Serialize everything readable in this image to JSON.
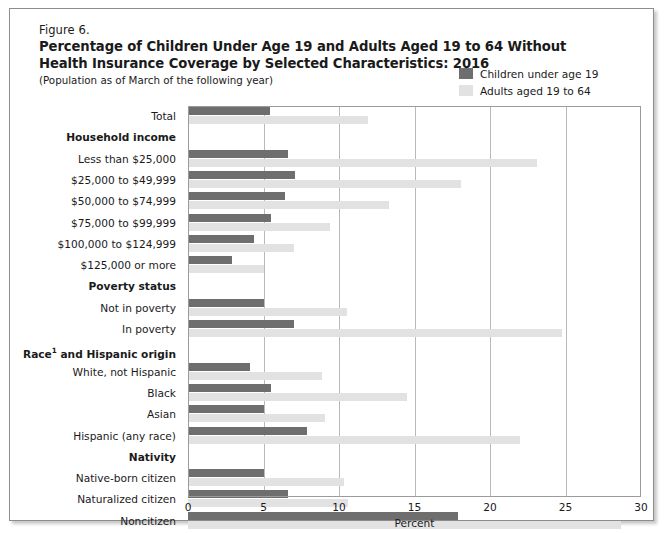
{
  "figure": {
    "number": "Figure 6.",
    "title_line1": "Percentage of Children Under Age 19 and Adults Aged 19 to 64 Without",
    "title_line2": "Health Insurance Coverage by Selected Characteristics: 2016",
    "subtitle": "(Population as of March of the following year)"
  },
  "legend": {
    "position": "top-right",
    "entries": [
      {
        "label": "Children under age 19",
        "color": "#6e6e6e"
      },
      {
        "label": "Adults aged 19 to 64",
        "color": "#e2e2e2"
      }
    ]
  },
  "colors": {
    "children_bar": "#6e6e6e",
    "adults_bar": "#e2e2e2",
    "gridline": "#b9b9b9",
    "frame": "#9b9b9b",
    "text": "#1a1a1a"
  },
  "chart_data": {
    "type": "bar",
    "orientation": "horizontal",
    "title": "Percentage of Children Under Age 19 and Adults Aged 19 to 64 Without Health Insurance Coverage by Selected Characteristics: 2016",
    "subtitle": "(Population as of March of the following year)",
    "xlabel": "Percent",
    "ylabel": "",
    "xlim": [
      0,
      30
    ],
    "xticks": [
      0,
      5,
      10,
      15,
      20,
      25,
      30
    ],
    "xtick_labels": [
      "0",
      "5",
      "10",
      "15",
      "20",
      "25",
      "30"
    ],
    "grid": "vertical",
    "legend_position": "top-right",
    "categories": [
      "Total",
      "Less than $25,000",
      "$25,000 to $49,999",
      "$50,000 to $74,999",
      "$75,000 to $99,999",
      "$100,000 to $124,999",
      "$125,000 or more",
      "Not in poverty",
      "In poverty",
      "White, not Hispanic",
      "Black",
      "Asian",
      "Hispanic (any race)",
      "Native-born citizen",
      "Naturalized citizen",
      "Noncitizen"
    ],
    "series": [
      {
        "name": "Children under age 19",
        "color": "#6e6e6e",
        "values": [
          5.4,
          6.6,
          7.1,
          6.4,
          5.5,
          4.4,
          2.9,
          5.0,
          7.0,
          4.1,
          5.5,
          5.0,
          7.9,
          5.0,
          6.6,
          17.9
        ]
      },
      {
        "name": "Adults aged 19 to 64",
        "color": "#e2e2e2",
        "values": [
          11.9,
          23.1,
          18.1,
          13.3,
          9.4,
          7.0,
          5.0,
          10.5,
          24.8,
          8.9,
          14.5,
          9.1,
          22.0,
          10.3,
          10.6,
          28.7
        ]
      }
    ]
  },
  "rows": [
    {
      "label": "Total",
      "type": "category",
      "children": 5.4,
      "adults": 11.9
    },
    {
      "label": "Household income",
      "type": "group"
    },
    {
      "label": "Less than $25,000",
      "type": "category",
      "children": 6.6,
      "adults": 23.1
    },
    {
      "label": "$25,000 to $49,999",
      "type": "category",
      "children": 7.1,
      "adults": 18.1
    },
    {
      "label": "$50,000 to $74,999",
      "type": "category",
      "children": 6.4,
      "adults": 13.3
    },
    {
      "label": "$75,000 to $99,999",
      "type": "category",
      "children": 5.5,
      "adults": 9.4
    },
    {
      "label": "$100,000 to $124,999",
      "type": "category",
      "children": 4.4,
      "adults": 7.0
    },
    {
      "label": "$125,000 or more",
      "type": "category",
      "children": 2.9,
      "adults": 5.0
    },
    {
      "label": "Poverty status",
      "type": "group"
    },
    {
      "label": "Not in poverty",
      "type": "category",
      "children": 5.0,
      "adults": 10.5
    },
    {
      "label": "In poverty",
      "type": "category",
      "children": 7.0,
      "adults": 24.8
    },
    {
      "label": "Race1 and Hispanic origin",
      "type": "group",
      "superscript": "1",
      "label_base": "Race",
      "label_rest": " and Hispanic origin"
    },
    {
      "label": "White, not Hispanic",
      "type": "category",
      "children": 4.1,
      "adults": 8.9
    },
    {
      "label": "Black",
      "type": "category",
      "children": 5.5,
      "adults": 14.5
    },
    {
      "label": "Asian",
      "type": "category",
      "children": 5.0,
      "adults": 9.1
    },
    {
      "label": "Hispanic (any race)",
      "type": "category",
      "children": 7.9,
      "adults": 22.0
    },
    {
      "label": "Nativity",
      "type": "group"
    },
    {
      "label": "Native-born citizen",
      "type": "category",
      "children": 5.0,
      "adults": 10.3
    },
    {
      "label": "Naturalized citizen",
      "type": "category",
      "children": 6.6,
      "adults": 10.6
    },
    {
      "label": "Noncitizen",
      "type": "category",
      "children": 17.9,
      "adults": 28.7
    }
  ],
  "xaxis": {
    "title": "Percent",
    "ticks": [
      "0",
      "5",
      "10",
      "15",
      "20",
      "25",
      "30"
    ]
  }
}
